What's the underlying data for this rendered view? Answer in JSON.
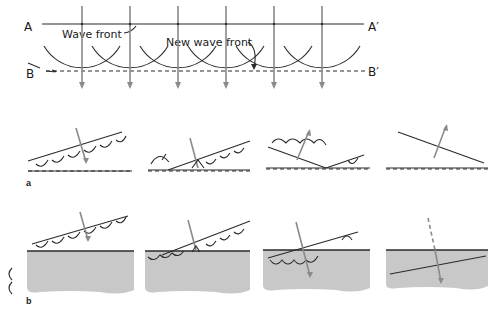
{
  "figure": {
    "top": {
      "label_A": "A",
      "label_A_prime": "A′",
      "label_B": "B",
      "label_B_prime": "B′",
      "wave_front_label": "Wave front",
      "new_wave_front_label": "New wave front",
      "ray_count": 6
    },
    "row_a": {
      "panel_label": "a",
      "description": "Reflection of a plane wave front at a surface (4 stages)",
      "panels": 4
    },
    "row_b": {
      "panel_label": "b",
      "description": "Refraction of a plane wave front entering a denser medium (4 stages)",
      "panels": 4
    },
    "colors": {
      "ink": "#2a2a2a",
      "ray": "#8a8a8a",
      "medium": "#c8c8c8",
      "background": "#ffffff"
    }
  }
}
